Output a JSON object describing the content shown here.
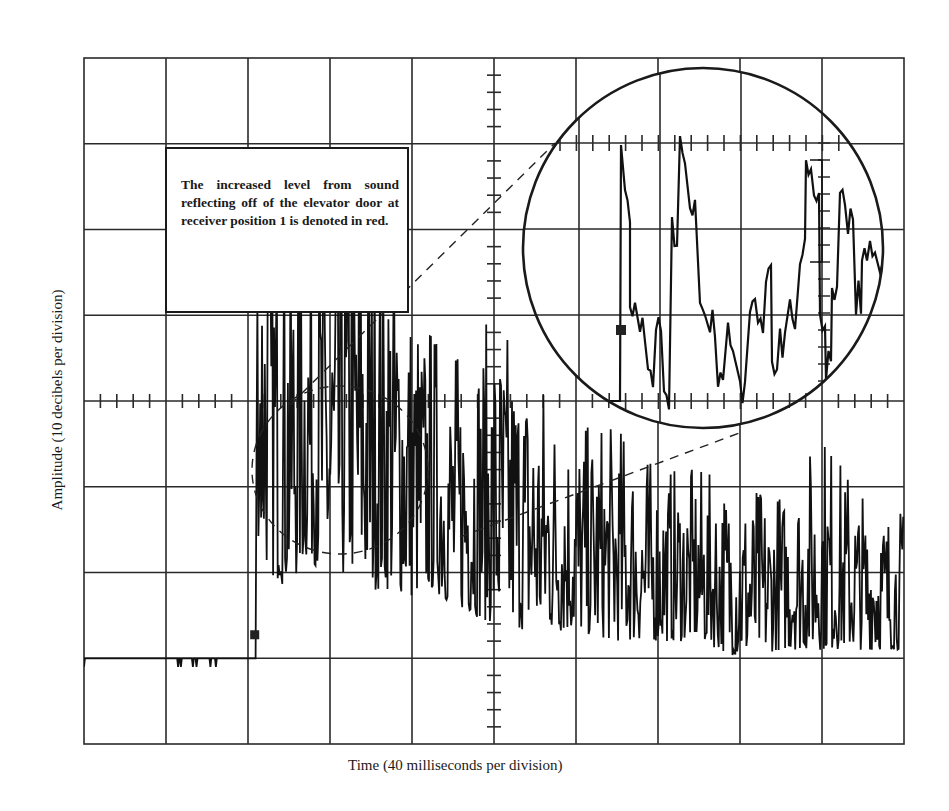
{
  "chart_data": {
    "type": "line",
    "title": "",
    "subtitle": "Oscilloscope trace of sound decay (impulse response)",
    "xlabel": "Time (40 milliseconds per division)",
    "ylabel": "Amplitude (10 decibels per division)",
    "grid": true,
    "x_divisions": 10,
    "y_divisions": 8,
    "x_unit_per_division_ms": 40,
    "y_unit_per_division_db": 10,
    "xlim_ms": [
      0,
      400
    ],
    "ylim_db_relative_to_floor": [
      -10,
      70
    ],
    "legend": [],
    "annotations": [
      {
        "type": "text_box",
        "text": "The increased level from sound reflecting off of the elevator door at receiver position 1 is denoted in red."
      },
      {
        "type": "magnifier",
        "description": "Dashed circle around onset region (~80–160 ms) expanded into large solid inset circle at upper right"
      }
    ],
    "series": [
      {
        "name": "Sound level trace",
        "description": "Noise floor until onset, abrupt rise, then noisy decaying envelope",
        "x_ms": [
          0,
          40,
          80,
          84,
          90,
          100,
          110,
          120,
          130,
          140,
          150,
          160,
          170,
          180,
          200,
          220,
          240,
          260,
          280,
          300,
          320,
          340,
          360,
          380,
          400
        ],
        "peak_db": [
          0,
          0,
          0,
          58,
          55,
          53,
          54,
          50,
          55,
          52,
          52,
          42,
          38,
          35,
          40,
          33,
          27,
          27,
          22,
          22,
          20,
          19,
          26,
          19,
          17
        ],
        "floor_db": [
          0,
          0,
          0,
          15,
          10,
          8,
          12,
          8,
          10,
          8,
          8,
          7,
          8,
          6,
          4,
          3,
          3,
          2,
          2,
          2,
          0,
          1,
          1,
          1,
          1
        ]
      }
    ]
  },
  "annotation": {
    "text": "The increased level from sound reflecting off of the elevator door at receiver position 1 is denoted in red."
  },
  "axes": {
    "x_label": "Time (40 milliseconds per division)",
    "y_label": "Amplitude (10 decibels per division)"
  }
}
